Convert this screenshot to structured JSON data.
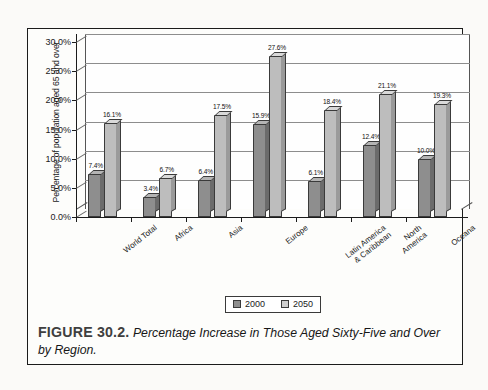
{
  "figure": {
    "caption_label": "FIGURE 30.2.",
    "caption_text": "Percentage Increase in Those Aged Sixty-Five and Over by Region."
  },
  "legend": {
    "items": [
      {
        "label": "2000",
        "color": "#8e8e8e"
      },
      {
        "label": "2050",
        "color": "#cfcfcf"
      }
    ]
  },
  "axis": {
    "y_title": "Percentage of population aged 65 and over",
    "y_ticks": [
      "0.0%",
      "5.0%",
      "10.0%",
      "15.0%",
      "20.0%",
      "25.0%",
      "30.0%"
    ]
  },
  "chart_data": {
    "type": "bar",
    "title": "",
    "subtitle": "",
    "xlabel": "",
    "ylabel": "Percentage of population aged 65 and over",
    "ylim": [
      0,
      30
    ],
    "ytick_values": [
      0,
      5,
      10,
      15,
      20,
      25,
      30
    ],
    "ytick_labels": [
      "0.0%",
      "5.0%",
      "10.0%",
      "15.0%",
      "20.0%",
      "25.0%",
      "30.0%"
    ],
    "grid": true,
    "legend_position": "bottom-center",
    "three_d": true,
    "categories": [
      "World Total",
      "Africa",
      "Asia",
      "Europe",
      "Latin America\n& Caribbean",
      "North\nAmerica",
      "Oceana"
    ],
    "series": [
      {
        "name": "2000",
        "color": "#8e8e8e",
        "values": [
          7.4,
          3.4,
          6.4,
          15.9,
          6.1,
          12.4,
          10.0
        ],
        "labels": [
          "7.4%",
          "3.4%",
          "6.4%",
          "15.9%",
          "6.1%",
          "12.4%",
          "10.0%"
        ]
      },
      {
        "name": "2050",
        "color": "#cfcfcf",
        "values": [
          16.1,
          6.7,
          17.5,
          27.6,
          18.4,
          21.1,
          19.3
        ],
        "labels": [
          "16.1%",
          "6.7%",
          "17.5%",
          "27.6%",
          "18.4%",
          "21.1%",
          "19.3%"
        ]
      }
    ]
  }
}
